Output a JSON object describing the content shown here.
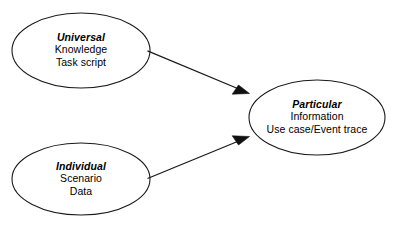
{
  "diagram": {
    "type": "flow-diagram",
    "background_color": "#ffffff",
    "stroke_color": "#1a1a1a",
    "text_color": "#000000",
    "nodes": [
      {
        "id": "universal",
        "shape": "ellipse",
        "title": "Universal",
        "lines": [
          "Knowledge",
          "Task script"
        ]
      },
      {
        "id": "individual",
        "shape": "ellipse",
        "title": "Individual",
        "lines": [
          "Scenario",
          "Data"
        ]
      },
      {
        "id": "particular",
        "shape": "ellipse",
        "title": "Particular",
        "lines": [
          "Information",
          "Use case/Event trace"
        ]
      }
    ],
    "edges": [
      {
        "id": "universal-to-particular",
        "from": "universal",
        "to": "particular",
        "label": "",
        "arrowhead": "solid-triangle"
      },
      {
        "id": "individual-to-particular",
        "from": "individual",
        "to": "particular",
        "label": "",
        "arrowhead": "solid-triangle"
      }
    ]
  }
}
